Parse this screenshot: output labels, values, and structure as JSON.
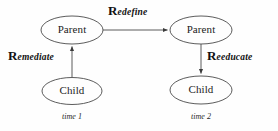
{
  "diagram": {
    "background_color": "#fefefe",
    "stroke_color": "#3a3a3a",
    "text_color": "#1c1c1c",
    "nodes": [
      {
        "id": "parent-time1",
        "label": "Parent",
        "shape": "ellipse",
        "cx": 72,
        "cy": 30,
        "rx": 31,
        "ry": 14
      },
      {
        "id": "child-time1",
        "label": "Child",
        "shape": "ellipse",
        "cx": 72,
        "cy": 91,
        "rx": 30,
        "ry": 13.5
      },
      {
        "id": "parent-time2",
        "label": "Parent",
        "shape": "ellipse",
        "cx": 201,
        "cy": 30,
        "rx": 31,
        "ry": 14
      },
      {
        "id": "child-time2",
        "label": "Child",
        "shape": "ellipse",
        "cx": 201,
        "cy": 90,
        "rx": 31,
        "ry": 14
      }
    ],
    "edges": [
      {
        "id": "edge-remediate",
        "label_cap": "R",
        "label_rest": "emediate",
        "from": "child-time1",
        "to": "parent-time1",
        "direction": "up",
        "label_x": 8,
        "label_y": 48
      },
      {
        "id": "edge-redefine",
        "label_cap": "R",
        "label_rest": "edefine",
        "from": "parent-time1",
        "to": "parent-time2",
        "direction": "right",
        "label_x": 108,
        "label_y": 3
      },
      {
        "id": "edge-reeducate",
        "label_cap": "R",
        "label_rest": "eeducate",
        "from": "parent-time2",
        "to": "child-time2",
        "direction": "down",
        "label_x": 207,
        "label_y": 48
      }
    ],
    "time_labels": [
      {
        "id": "time-label-1",
        "text": "time 1",
        "x": 52,
        "y": 112,
        "width": 40
      },
      {
        "id": "time-label-2",
        "text": "time 2",
        "x": 181,
        "y": 112,
        "width": 40
      }
    ]
  }
}
